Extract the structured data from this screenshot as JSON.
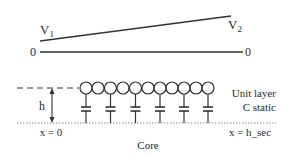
{
  "diagram": {
    "voltage_profile": {
      "left_voltage_label": "V",
      "left_voltage_subscript": "1",
      "right_voltage_label": "V",
      "right_voltage_subscript": "2",
      "left_zero_label": "0",
      "right_zero_label": "0"
    },
    "layer": {
      "height_label": "h",
      "layer_name_line1": "Unit layer",
      "layer_name_line2": "C static",
      "left_position_label": "x = 0",
      "right_position_label": "x = h_sec",
      "core_label": "Core",
      "resistor_circle_count": 11,
      "capacitor_count": 6
    },
    "colors": {
      "line": "#333333",
      "text": "#2a2a2a",
      "dotted": "#888888"
    }
  }
}
